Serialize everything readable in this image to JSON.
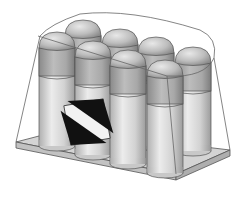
{
  "figure": {
    "width": 249,
    "height": 210,
    "background": "#ffffff"
  },
  "colors": {
    "can_light": "#e6e6e6",
    "can_mid": "#c4c4c4",
    "can_dark": "#8f8f8f",
    "cap_band_dark": "#9a9a9a",
    "tray_top": "#d6d6d6",
    "tray_edge": "#b8b8b8",
    "outline": "#555555",
    "wrap_line": "#6a6a6a",
    "mark_black": "#111111",
    "mark_white": "#f2f2f2"
  },
  "cans": {
    "back_row": [
      {
        "cx": 83,
        "top": 20
      },
      {
        "cx": 120,
        "top": 29
      },
      {
        "cx": 156,
        "top": 37
      },
      {
        "cx": 193,
        "top": 47
      }
    ],
    "front_row": [
      {
        "cx": 57,
        "top": 32
      },
      {
        "cx": 93,
        "top": 41
      },
      {
        "cx": 128,
        "top": 50
      },
      {
        "cx": 165,
        "top": 60
      }
    ]
  },
  "label": {
    "type": "limited-quantity-mark"
  }
}
